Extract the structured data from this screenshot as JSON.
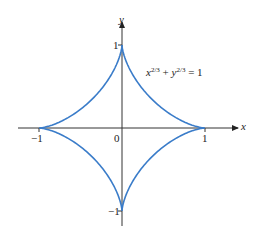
{
  "chart_data": {
    "type": "line",
    "title": "",
    "equation": "x^(2/3) + y^(2/3) = 1",
    "xlabel": "x",
    "ylabel": "y",
    "xlim": [
      -1.1,
      1.25
    ],
    "ylim": [
      -1.3,
      1.3
    ],
    "x_ticks": [
      "-1",
      "0",
      "1"
    ],
    "y_ticks": [
      "1",
      "-1"
    ],
    "grid": false,
    "series": [
      {
        "name": "astroid",
        "color": "#3a7cc9",
        "parametric": "x = cos^3(t), y = sin^3(t), t in [0, 2pi]",
        "points": [
          [
            1,
            0
          ],
          [
            0.65,
            0.05
          ],
          [
            0.35,
            0.19
          ],
          [
            0.19,
            0.35
          ],
          [
            0.05,
            0.65
          ],
          [
            0,
            1
          ],
          [
            -0.05,
            0.65
          ],
          [
            -0.19,
            0.35
          ],
          [
            -0.35,
            0.19
          ],
          [
            -0.65,
            0.05
          ],
          [
            -1,
            0
          ],
          [
            -0.65,
            -0.05
          ],
          [
            -0.35,
            -0.19
          ],
          [
            -0.19,
            -0.35
          ],
          [
            -0.05,
            -0.65
          ],
          [
            0,
            -1
          ],
          [
            0.05,
            -0.65
          ],
          [
            0.19,
            -0.35
          ],
          [
            0.35,
            -0.19
          ],
          [
            0.65,
            -0.05
          ],
          [
            1,
            0
          ]
        ]
      }
    ]
  },
  "labels": {
    "x_axis": "x",
    "y_axis": "y",
    "origin": "0",
    "x_pos1": "1",
    "x_neg1": "−1",
    "y_pos1": "1",
    "y_neg1": "−1",
    "eq_x": "x",
    "eq_exp1": "2/3",
    "eq_plus": " + ",
    "eq_y": "y",
    "eq_exp2": "2/3",
    "eq_rhs": " = 1"
  },
  "colors": {
    "curve": "#3a7cc9",
    "axis": "#333333"
  }
}
